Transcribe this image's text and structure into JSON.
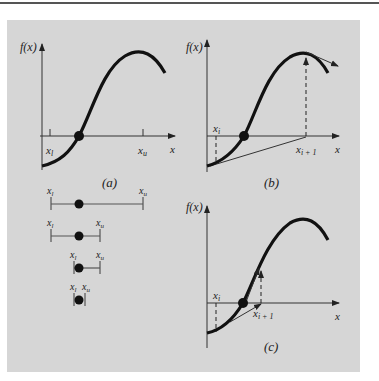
{
  "figure": {
    "colors": {
      "background": "#ffffff",
      "panel": "#d6d6d6",
      "ink": "#111111",
      "rule": "#555555"
    },
    "panel_a": {
      "ylabel": "f(x)",
      "xlabel": "x",
      "x_lower": "x",
      "x_lower_sub": "l",
      "x_upper": "x",
      "x_upper_sub": "u",
      "caption": "(a)"
    },
    "panel_b": {
      "ylabel": "f(x)",
      "xlabel": "x",
      "xi": "x",
      "xi_sub": "i",
      "xi1": "x",
      "xi1_sub": "i + 1",
      "caption": "(b)"
    },
    "panel_c": {
      "ylabel": "f(x)",
      "xlabel": "x",
      "xi": "x",
      "xi_sub": "i",
      "xi1": "x",
      "xi1_sub": "i + 1",
      "caption": "(c)"
    },
    "bisection": [
      {
        "lower": "x",
        "lower_sub": "l",
        "upper": "x",
        "upper_sub": "u"
      },
      {
        "lower": "x",
        "lower_sub": "l",
        "upper": "x",
        "upper_sub": "u"
      },
      {
        "lower": "x",
        "lower_sub": "l",
        "upper": "x",
        "upper_sub": "u"
      },
      {
        "lower": "x",
        "lower_sub": "l",
        "upper": "x",
        "upper_sub": "u"
      }
    ]
  }
}
